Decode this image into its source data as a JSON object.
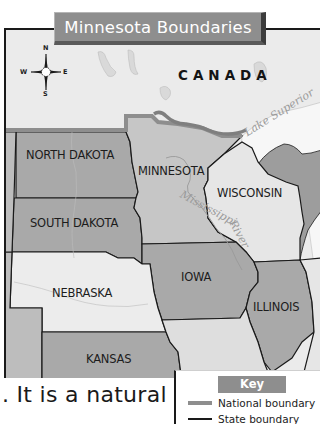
{
  "map": {
    "title": "Minnesota Boundaries",
    "compass": {
      "n": "N",
      "s": "S",
      "e": "E",
      "w": "W"
    },
    "country_label": "CANADA",
    "states": [
      {
        "name": "NORTH DAKOTA",
        "fill": "#a9a9a9"
      },
      {
        "name": "MINNESOTA",
        "fill": "#c6c6c6"
      },
      {
        "name": "WISCONSIN",
        "fill": "#e6e6e6"
      },
      {
        "name": "SOUTH DAKOTA",
        "fill": "#a9a9a9"
      },
      {
        "name": "IOWA",
        "fill": "#a9a9a9"
      },
      {
        "name": "NEBRASKA",
        "fill": "#ececec"
      },
      {
        "name": "ILLINOIS",
        "fill": "#a9a9a9"
      },
      {
        "name": "KANSAS",
        "fill": "#a9a9a9"
      }
    ],
    "water_labels": {
      "lake": "Lake Superior",
      "river_part1": "Mississippi",
      "river_part2": "River"
    }
  },
  "key": {
    "title": "Key",
    "items": [
      {
        "label": "National boundary",
        "line_color": "#8e8e8e"
      },
      {
        "label": "State boundary",
        "line_color": "#1a1a1a"
      }
    ]
  },
  "body_text": ". It is a natural"
}
